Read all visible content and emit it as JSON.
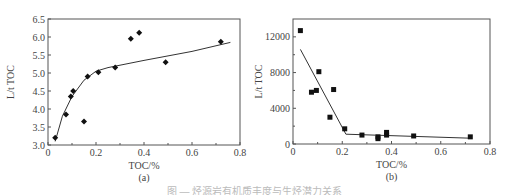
{
  "chart_data": [
    {
      "type": "scatter",
      "panel_label": "(a)",
      "title": "",
      "xlabel": "TOC/%",
      "ylabel": "L/t TOC",
      "xlim": [
        0,
        0.8
      ],
      "ylim": [
        3.0,
        6.5
      ],
      "xticks": [
        "0",
        "0.2",
        "0.4",
        "0.6",
        "0.8"
      ],
      "yticks": [
        "3.0",
        "3.5",
        "4.0",
        "4.5",
        "5.0",
        "5.5",
        "6.0",
        "6.5"
      ],
      "marker": "diamond",
      "points": [
        [
          0.03,
          3.2
        ],
        [
          0.075,
          3.85
        ],
        [
          0.095,
          4.35
        ],
        [
          0.105,
          4.5
        ],
        [
          0.15,
          3.65
        ],
        [
          0.165,
          4.9
        ],
        [
          0.21,
          5.02
        ],
        [
          0.28,
          5.15
        ],
        [
          0.345,
          5.95
        ],
        [
          0.38,
          6.12
        ],
        [
          0.49,
          5.3
        ],
        [
          0.72,
          5.87
        ]
      ],
      "fit_line": [
        [
          0.03,
          3.1
        ],
        [
          0.06,
          3.8
        ],
        [
          0.1,
          4.35
        ],
        [
          0.15,
          4.8
        ],
        [
          0.2,
          5.05
        ],
        [
          0.25,
          5.15
        ],
        [
          0.4,
          5.35
        ],
        [
          0.6,
          5.6
        ],
        [
          0.76,
          5.85
        ]
      ],
      "grid": false
    },
    {
      "type": "scatter",
      "panel_label": "(b)",
      "title": "",
      "xlabel": "TOC/%",
      "ylabel": "L/t TOC",
      "xlim": [
        0,
        0.8
      ],
      "ylim": [
        0,
        14000
      ],
      "xticks": [
        "0",
        "0.2",
        "0.4",
        "0.6",
        "0.8"
      ],
      "yticks": [
        "0",
        "4000",
        "8000",
        "12000"
      ],
      "marker": "square",
      "points": [
        [
          0.03,
          12700
        ],
        [
          0.075,
          5800
        ],
        [
          0.095,
          6000
        ],
        [
          0.105,
          8100
        ],
        [
          0.15,
          3000
        ],
        [
          0.165,
          6100
        ],
        [
          0.21,
          1700
        ],
        [
          0.28,
          1000
        ],
        [
          0.345,
          600
        ],
        [
          0.345,
          800
        ],
        [
          0.38,
          1000
        ],
        [
          0.38,
          1300
        ],
        [
          0.49,
          900
        ],
        [
          0.72,
          800
        ]
      ],
      "fit_line": [
        [
          0.03,
          10600
        ],
        [
          0.215,
          1100
        ],
        [
          0.72,
          650
        ]
      ],
      "grid": false
    }
  ],
  "caption": "图 — 烃源岩有机质丰度与生烃潜力关系"
}
